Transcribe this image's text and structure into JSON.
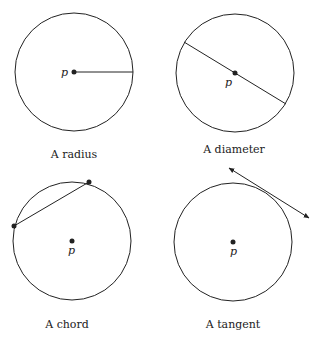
{
  "figures": [
    {
      "caption": "A radius",
      "point_label": "p"
    },
    {
      "caption": "A diameter",
      "point_label": "p"
    },
    {
      "caption": "A chord",
      "point_label": "p"
    },
    {
      "caption": "A tangent",
      "point_label": "p"
    }
  ],
  "colors": {
    "stroke": "#222222",
    "background": "#ffffff"
  }
}
